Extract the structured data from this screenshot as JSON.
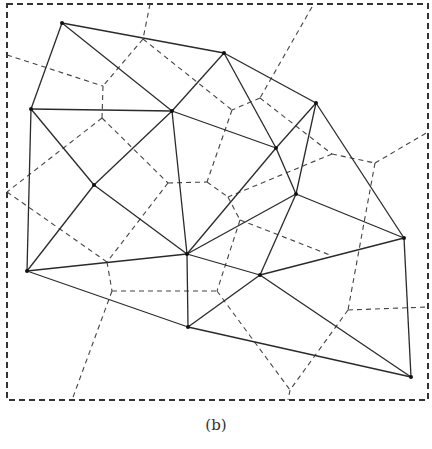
{
  "figure": {
    "caption": "(b)",
    "colors": {
      "solid_edges": "#2a2a2a",
      "dashed_edges": "#444444",
      "points": "#111111",
      "background": "#ffffff"
    },
    "bounding_box": {
      "x1": 7,
      "y1": 4,
      "x2": 428,
      "y2": 400
    },
    "points": [
      [
        62,
        23
      ],
      [
        224,
        53
      ],
      [
        316,
        103
      ],
      [
        31,
        109
      ],
      [
        172,
        111
      ],
      [
        276,
        148
      ],
      [
        94,
        185
      ],
      [
        296,
        194
      ],
      [
        404,
        238
      ],
      [
        187,
        254
      ],
      [
        27,
        271
      ],
      [
        260,
        275
      ],
      [
        188,
        327
      ],
      [
        411,
        377
      ]
    ],
    "delaunay_edges": [
      [
        0,
        1
      ],
      [
        1,
        2
      ],
      [
        0,
        3
      ],
      [
        0,
        4
      ],
      [
        3,
        4
      ],
      [
        1,
        4
      ],
      [
        1,
        5
      ],
      [
        4,
        5
      ],
      [
        2,
        5
      ],
      [
        2,
        7
      ],
      [
        5,
        7
      ],
      [
        2,
        8
      ],
      [
        3,
        6
      ],
      [
        3,
        10
      ],
      [
        4,
        6
      ],
      [
        6,
        10
      ],
      [
        6,
        9
      ],
      [
        4,
        9
      ],
      [
        5,
        9
      ],
      [
        7,
        9
      ],
      [
        7,
        8
      ],
      [
        7,
        11
      ],
      [
        9,
        11
      ],
      [
        8,
        11
      ],
      [
        9,
        10
      ],
      [
        10,
        12
      ],
      [
        9,
        12
      ],
      [
        11,
        12
      ],
      [
        11,
        13
      ],
      [
        12,
        13
      ],
      [
        8,
        13
      ]
    ],
    "voronoi_segments": [
      [
        [
          150,
          4
        ],
        [
          143,
          39
        ]
      ],
      [
        [
          143,
          39
        ],
        [
          103,
          86
        ]
      ],
      [
        [
          7,
          55
        ],
        [
          103,
          86
        ]
      ],
      [
        [
          103,
          86
        ],
        [
          102,
          118
        ]
      ],
      [
        [
          143,
          39
        ],
        [
          232,
          110
        ]
      ],
      [
        [
          312,
          7
        ],
        [
          260,
          98
        ]
      ],
      [
        [
          260,
          98
        ],
        [
          232,
          110
        ]
      ],
      [
        [
          260,
          98
        ],
        [
          332,
          154
        ]
      ],
      [
        [
          232,
          110
        ],
        [
          207,
          182
        ]
      ],
      [
        [
          102,
          118
        ],
        [
          168,
          183
        ]
      ],
      [
        [
          102,
          118
        ],
        [
          7,
          192
        ]
      ],
      [
        [
          168,
          183
        ],
        [
          207,
          182
        ]
      ],
      [
        [
          207,
          182
        ],
        [
          228,
          197
        ]
      ],
      [
        [
          228,
          197
        ],
        [
          240,
          220
        ]
      ],
      [
        [
          332,
          154
        ],
        [
          375,
          163
        ]
      ],
      [
        [
          375,
          163
        ],
        [
          428,
          132
        ]
      ],
      [
        [
          332,
          154
        ],
        [
          228,
          197
        ]
      ],
      [
        [
          375,
          163
        ],
        [
          348,
          310
        ]
      ],
      [
        [
          240,
          220
        ],
        [
          330,
          255
        ]
      ],
      [
        [
          240,
          220
        ],
        [
          217,
          291
        ]
      ],
      [
        [
          168,
          183
        ],
        [
          107,
          262
        ]
      ],
      [
        [
          7,
          192
        ],
        [
          107,
          262
        ]
      ],
      [
        [
          107,
          262
        ],
        [
          112,
          291
        ]
      ],
      [
        [
          112,
          291
        ],
        [
          217,
          291
        ]
      ],
      [
        [
          112,
          291
        ],
        [
          72,
          400
        ]
      ],
      [
        [
          217,
          291
        ],
        [
          290,
          390
        ]
      ],
      [
        [
          348,
          310
        ],
        [
          290,
          390
        ]
      ],
      [
        [
          348,
          310
        ],
        [
          428,
          307
        ]
      ],
      [
        [
          290,
          390
        ],
        [
          288,
          400
        ]
      ]
    ]
  }
}
